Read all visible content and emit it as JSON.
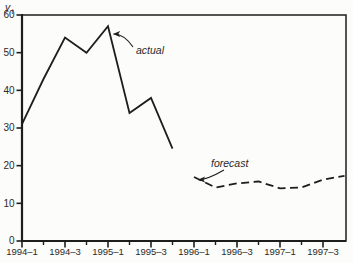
{
  "figure": {
    "background": "#fcfcfa",
    "ink": "#1d1d1d",
    "text_color": "#2a2a2a"
  },
  "chart_data": {
    "type": "line",
    "title": "",
    "xlabel": "",
    "ylabel": {
      "main": "y",
      "sub": "t"
    },
    "ylim": [
      0,
      60
    ],
    "y_ticks": [
      0,
      10,
      20,
      30,
      40,
      50,
      60
    ],
    "x_axis": {
      "unit": "quarter",
      "range_start": "1994-1",
      "range_end": "1997-4",
      "major_tick_labels": [
        "1994–1",
        "1994–3",
        "1995–1",
        "1995–3",
        "1996–1",
        "1996–3",
        "1997–1",
        "1997–3"
      ],
      "minor_ticks_between_majors": true
    },
    "grid": false,
    "legend": "none",
    "series": [
      {
        "name": "actual",
        "line_style": "solid",
        "x": [
          "1994-1",
          "1994-2",
          "1994-3",
          "1994-4",
          "1995-1",
          "1995-2",
          "1995-3",
          "1995-4"
        ],
        "values": [
          31,
          43,
          54,
          50,
          57,
          34,
          38,
          24.5
        ]
      },
      {
        "name": "forecast",
        "line_style": "dashed",
        "x": [
          "1996-1",
          "1996-2",
          "1996-3",
          "1996-4",
          "1997-1",
          "1997-2",
          "1997-3",
          "1997-4"
        ],
        "values": [
          17,
          14.2,
          15.3,
          15.8,
          14,
          14.2,
          16.3,
          17.3
        ]
      }
    ],
    "annotations": [
      {
        "label": "actual",
        "points_to": {
          "x": "1995-1",
          "value": 57
        }
      },
      {
        "label": "forecast",
        "points_to": {
          "x": "1996-1",
          "value": 17
        }
      }
    ]
  }
}
